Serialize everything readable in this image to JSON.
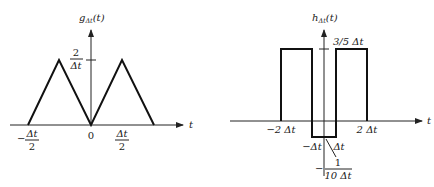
{
  "figure_left": {
    "function_label": "g",
    "function_subscript": "Δt",
    "function_arg": "(t)",
    "x_axis_label": "t",
    "peak_label_num": "2",
    "peak_label_den": "Δt",
    "ticks": {
      "neg_half_sign": "−",
      "neg_half_num": "Δt",
      "neg_half_den": "2",
      "zero": "0",
      "pos_half_num": "Δt",
      "pos_half_den": "2"
    }
  },
  "figure_right": {
    "function_label": "h",
    "function_subscript": "Δt",
    "function_arg": "(t)",
    "x_axis_label": "t",
    "top_label": "3/5 Δt",
    "ticks": {
      "neg_two": "−2 Δt",
      "pos_two": "2 Δt",
      "neg_one": "−Δt",
      "pos_one": "Δt"
    },
    "low_label_sign": "−",
    "low_label_num": "1",
    "low_label_den": "10 Δt"
  },
  "colors": {
    "line": "#111111",
    "background": "#ffffff"
  }
}
